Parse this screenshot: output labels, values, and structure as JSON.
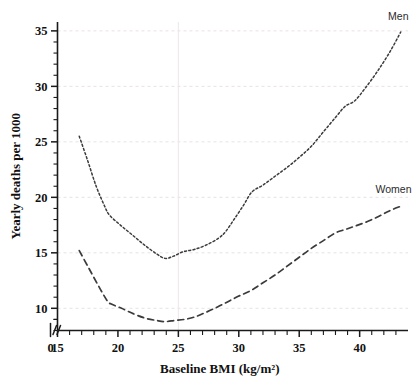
{
  "chart_data": {
    "type": "line",
    "title": "",
    "xlabel": "Baseline BMI (kg/m²)",
    "ylabel": "Yearly deaths per 1000",
    "xlim": [
      15,
      44
    ],
    "ylim": [
      8,
      35.8
    ],
    "grid": true,
    "legend_position": "inline-right",
    "x_tick_labels": [
      "0",
      "15",
      "20",
      "25",
      "30",
      "35",
      "40"
    ],
    "x_major_ticks": [
      15,
      20,
      25,
      30,
      35,
      40
    ],
    "x_minor_step": 1,
    "y_tick_labels": [
      "10",
      "15",
      "20",
      "25",
      "30",
      "35"
    ],
    "y_major_ticks": [
      10,
      15,
      20,
      25,
      30,
      35
    ],
    "y_minor_step": 1,
    "axis_break": true,
    "axis_break_label": "0",
    "series": [
      {
        "name": "Men",
        "style": "dotted",
        "label_x": 43.2,
        "label_y": 36.0,
        "x": [
          16.8,
          17.5,
          18.2,
          18.9,
          19.3,
          20.2,
          21.2,
          22.2,
          23.2,
          23.9,
          24.6,
          25.4,
          26.3,
          27.3,
          28.3,
          28.9,
          29.6,
          30.4,
          31.1,
          32.0,
          33.0,
          34.0,
          35.0,
          36.0,
          37.0,
          38.0,
          38.8,
          39.6,
          40.5,
          41.5,
          42.5,
          43.4
        ],
        "y": [
          25.5,
          23.3,
          21.0,
          19.2,
          18.4,
          17.5,
          16.6,
          15.7,
          14.9,
          14.5,
          14.7,
          15.1,
          15.3,
          15.7,
          16.3,
          16.9,
          18.0,
          19.3,
          20.5,
          21.1,
          21.9,
          22.7,
          23.6,
          24.6,
          25.9,
          27.2,
          28.2,
          28.7,
          29.9,
          31.4,
          33.1,
          34.9
        ]
      },
      {
        "name": "Women",
        "style": "dashed",
        "label_x": 42.8,
        "label_y": 20.4,
        "x": [
          16.8,
          17.6,
          18.4,
          19.1,
          19.4,
          20.3,
          21.3,
          22.3,
          23.2,
          23.9,
          24.7,
          25.5,
          26.3,
          27.2,
          28.2,
          29.1,
          30.0,
          31.0,
          32.0,
          33.0,
          34.0,
          35.0,
          36.0,
          37.0,
          38.0,
          38.8,
          39.6,
          40.6,
          41.6,
          42.5,
          43.4
        ],
        "y": [
          15.2,
          13.6,
          12.0,
          10.7,
          10.4,
          10.0,
          9.5,
          9.1,
          8.9,
          8.8,
          8.9,
          9.0,
          9.2,
          9.6,
          10.1,
          10.6,
          11.1,
          11.6,
          12.3,
          13.0,
          13.8,
          14.6,
          15.4,
          16.1,
          16.8,
          17.1,
          17.4,
          17.8,
          18.3,
          18.8,
          19.2
        ]
      }
    ]
  },
  "labels": {
    "men": "Men",
    "women": "Women",
    "x_title": "Baseline BMI (kg/m²)",
    "y_title": "Yearly deaths per 1000"
  },
  "colors": {
    "ink": "#1a1a1a",
    "curve": "#3b3b3b",
    "gridline": "#e9dede",
    "background": "#ffffff"
  }
}
